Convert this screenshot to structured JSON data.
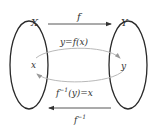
{
  "diagram": {
    "sets": {
      "domain": {
        "label": "X",
        "element": "x"
      },
      "codomain": {
        "label": "Y",
        "element": "y"
      }
    },
    "arrows": {
      "forward": {
        "label": "f"
      },
      "inverse": {
        "label_base": "f",
        "label_sup": "−1"
      }
    },
    "equations": {
      "forward": "y=f(x)",
      "inverse_base": "f",
      "inverse_sup": "−1",
      "inverse_rest": "(y)=x"
    },
    "colors": {
      "set_outline": "#2a2a2a",
      "mapping_curve": "#b0b0b0",
      "arrow": "#444444",
      "text": "#333333"
    }
  }
}
